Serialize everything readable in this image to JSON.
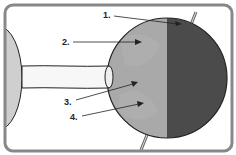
{
  "diagram": {
    "type": "sun-earth day/night illustration",
    "elements": [
      "sun",
      "light-beam",
      "earth",
      "earth-axis"
    ],
    "earth": {
      "day_side_color": "#a9a9a9",
      "night_side_color": "#4b4b4b"
    },
    "labels": [
      {
        "id": "1",
        "text": "1."
      },
      {
        "id": "2",
        "text": "2."
      },
      {
        "id": "3",
        "text": "3."
      },
      {
        "id": "4",
        "text": "4."
      }
    ]
  }
}
